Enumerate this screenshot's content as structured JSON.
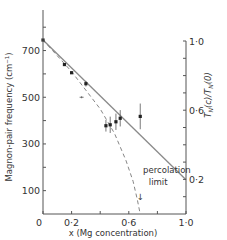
{
  "chart_data": {
    "type": "scatter",
    "title": "",
    "xlabel": "x (Mg concentration)",
    "ylabel": "Magnon-pair frequency (cm⁻¹)",
    "y2label": "T_N(c)/T_N(0)",
    "xlim": [
      0,
      1.0
    ],
    "ylim": [
      0,
      880
    ],
    "y2lim": [
      0,
      1.0
    ],
    "x_ticks": [
      0,
      0.2,
      0.4,
      0.6,
      0.8,
      1.0
    ],
    "x_tick_labels": [
      {
        "value": 0,
        "label": "0"
      },
      {
        "value": 0.2,
        "label": "0·2"
      },
      {
        "value": 0.6,
        "label": "0·6"
      },
      {
        "value": 1.0,
        "label": "1·0"
      }
    ],
    "y_ticks": [
      100,
      200,
      300,
      400,
      500,
      600,
      700,
      800
    ],
    "y_tick_labels": [
      {
        "value": 700,
        "label": "700"
      },
      {
        "value": 500,
        "label": "500"
      },
      {
        "value": 300,
        "label": "300"
      },
      {
        "value": 100,
        "label": "100"
      }
    ],
    "y2_ticks": [
      0.1,
      0.2,
      0.3,
      0.4,
      0.5,
      0.6,
      0.7,
      0.8,
      0.9,
      1.0
    ],
    "y2_tick_labels": [
      {
        "value": 1.0,
        "label": "1·0"
      },
      {
        "value": 0.6,
        "label": "0·6"
      },
      {
        "value": 0.2,
        "label": "0·2"
      }
    ],
    "series": [
      {
        "name": "Magnon-pair frequency (measured)",
        "style": "points-with-error-bars",
        "points": [
          {
            "x": 0.0,
            "y": 745,
            "err": 0
          },
          {
            "x": 0.15,
            "y": 640,
            "err": 0
          },
          {
            "x": 0.2,
            "y": 605,
            "err": 0
          },
          {
            "x": 0.3,
            "y": 558,
            "err": 12
          },
          {
            "x": 0.44,
            "y": 378,
            "err": 25
          },
          {
            "x": 0.47,
            "y": 382,
            "err": 35
          },
          {
            "x": 0.51,
            "y": 395,
            "err": 35
          },
          {
            "x": 0.54,
            "y": 410,
            "err": 35
          },
          {
            "x": 0.68,
            "y": 418,
            "err": 55
          }
        ]
      },
      {
        "name": "Outlier marker",
        "style": "plus",
        "points": [
          {
            "x": 0.27,
            "y": 500
          }
        ]
      },
      {
        "name": "T_N(c)/T_N(0) linear",
        "style": "solid-line",
        "points": [
          {
            "x": 0.0,
            "y": 745
          },
          {
            "x": 1.0,
            "y": 147
          }
        ]
      },
      {
        "name": "Dashed curve (to percolation limit)",
        "style": "dashed-line",
        "points": [
          {
            "x": 0.0,
            "y": 745
          },
          {
            "x": 0.2,
            "y": 610
          },
          {
            "x": 0.4,
            "y": 450
          },
          {
            "x": 0.5,
            "y": 345
          },
          {
            "x": 0.58,
            "y": 230
          },
          {
            "x": 0.63,
            "y": 140
          },
          {
            "x": 0.66,
            "y": 60
          },
          {
            "x": 0.68,
            "y": 0
          }
        ]
      }
    ],
    "annotations": [
      {
        "text": "percolation",
        "x": 0.7,
        "y": 175
      },
      {
        "text": "limit",
        "x": 0.74,
        "y": 125
      },
      {
        "text": "↓",
        "x": 0.68,
        "y": 60,
        "kind": "arrow"
      }
    ],
    "grid": false,
    "legend": null
  }
}
